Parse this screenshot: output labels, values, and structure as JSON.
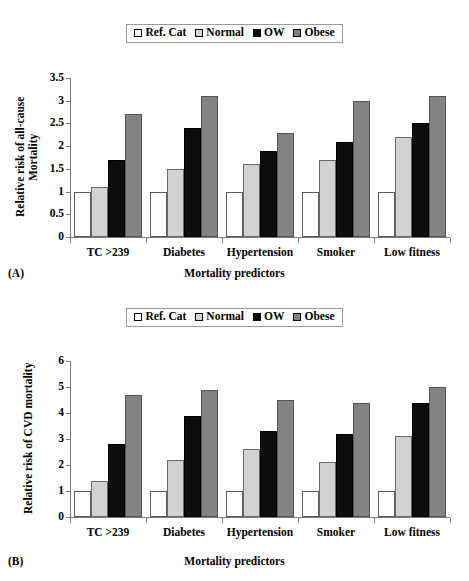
{
  "figure": {
    "panels": [
      {
        "tag": "(A)",
        "legend": [
          {
            "label": "Ref. Cat",
            "color": "#ffffff",
            "key": "ref"
          },
          {
            "label": "Normal",
            "color": "#d4d4d4",
            "key": "normal"
          },
          {
            "label": "OW",
            "color": "#0a0a0a",
            "key": "ow"
          },
          {
            "label": "Obese",
            "color": "#808080",
            "key": "obese"
          }
        ]
      },
      {
        "tag": "(B)",
        "legend": [
          {
            "label": "Ref. Cat",
            "color": "#ffffff",
            "key": "ref"
          },
          {
            "label": "Normal",
            "color": "#d4d4d4",
            "key": "normal"
          },
          {
            "label": "OW",
            "color": "#0a0a0a",
            "key": "ow"
          },
          {
            "label": "Obese",
            "color": "#808080",
            "key": "obese"
          }
        ]
      }
    ]
  },
  "chart_data": [
    {
      "type": "bar",
      "panel": "(A)",
      "title": "",
      "xlabel": "Mortality predictors",
      "ylabel": "Relative risk of all-cause\nMortality",
      "ylim": [
        0,
        3.5
      ],
      "yticks": [
        0,
        0.5,
        1,
        1.5,
        2,
        2.5,
        3,
        3.5
      ],
      "ytick_labels": [
        "0",
        "0.5",
        "1",
        "1.5",
        "2",
        "2.5",
        "3",
        "3.5"
      ],
      "grid": false,
      "legend_position": "top-center",
      "categories": [
        "TC >239",
        "Diabetes",
        "Hypertension",
        "Smoker",
        "Low fitness"
      ],
      "series": [
        {
          "name": "Ref. Cat",
          "color": "#ffffff",
          "values": [
            1.0,
            1.0,
            1.0,
            1.0,
            1.0
          ]
        },
        {
          "name": "Normal",
          "color": "#d2d2d2",
          "values": [
            1.1,
            1.5,
            1.6,
            1.7,
            2.2
          ]
        },
        {
          "name": "OW",
          "color": "#0d0d0d",
          "values": [
            1.7,
            2.4,
            1.9,
            2.1,
            2.5
          ]
        },
        {
          "name": "Obese",
          "color": "#838383",
          "values": [
            2.7,
            3.1,
            2.3,
            3.0,
            3.1
          ]
        }
      ]
    },
    {
      "type": "bar",
      "panel": "(B)",
      "title": "",
      "xlabel": "Mortality predictors",
      "ylabel": "Relative risk of CVD mortality",
      "ylim": [
        0,
        6
      ],
      "yticks": [
        0,
        1,
        2,
        3,
        4,
        5,
        6
      ],
      "ytick_labels": [
        "0",
        "1",
        "2",
        "3",
        "4",
        "5",
        "6"
      ],
      "grid": false,
      "legend_position": "top-center",
      "categories": [
        "TC >239",
        "Diabetes",
        "Hypertension",
        "Smoker",
        "Low fitness"
      ],
      "series": [
        {
          "name": "Ref. Cat",
          "color": "#ffffff",
          "values": [
            1.0,
            1.0,
            1.0,
            1.0,
            1.0
          ]
        },
        {
          "name": "Normal",
          "color": "#d2d2d2",
          "values": [
            1.4,
            2.2,
            2.6,
            2.1,
            3.1
          ]
        },
        {
          "name": "OW",
          "color": "#0d0d0d",
          "values": [
            2.8,
            3.9,
            3.3,
            3.2,
            4.4
          ]
        },
        {
          "name": "Obese",
          "color": "#838383",
          "values": [
            4.7,
            4.9,
            4.5,
            4.4,
            5.0
          ]
        }
      ]
    }
  ]
}
